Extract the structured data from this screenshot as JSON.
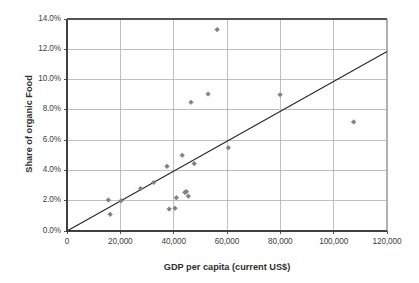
{
  "chart_data": {
    "type": "scatter",
    "title": "",
    "xlabel": "GDP per capita (current US$)",
    "ylabel": "Share of organic Food",
    "xlim": [
      0,
      120000
    ],
    "ylim": [
      0,
      0.14
    ],
    "grid": true,
    "legend": false,
    "x_ticks": [
      0,
      20000,
      40000,
      60000,
      80000,
      100000,
      120000
    ],
    "x_tick_labels": [
      "0",
      "20,000",
      "40,000",
      "60,000",
      "80,000",
      "100,000",
      "120,000"
    ],
    "y_ticks": [
      0.0,
      0.02,
      0.04,
      0.06,
      0.08,
      0.1,
      0.12,
      0.14
    ],
    "y_tick_labels": [
      "0.0%",
      "2.0%",
      "4.0%",
      "6.0%",
      "8.0%",
      "10.0%",
      "12.0%",
      "14.0%"
    ],
    "marker_color": "#808080",
    "trendline_color": "#262626",
    "grid_color": "#b0b0b0",
    "axis_color": "#404040",
    "points": [
      {
        "x": 15500,
        "y": 2.05
      },
      {
        "x": 16200,
        "y": 1.1
      },
      {
        "x": 20300,
        "y": 2.0
      },
      {
        "x": 27600,
        "y": 2.8
      },
      {
        "x": 32500,
        "y": 3.2
      },
      {
        "x": 37500,
        "y": 4.27
      },
      {
        "x": 38300,
        "y": 1.45
      },
      {
        "x": 40500,
        "y": 1.5
      },
      {
        "x": 41000,
        "y": 2.2
      },
      {
        "x": 43200,
        "y": 5.0
      },
      {
        "x": 44200,
        "y": 2.55
      },
      {
        "x": 44800,
        "y": 2.6
      },
      {
        "x": 45500,
        "y": 2.3
      },
      {
        "x": 46500,
        "y": 8.5
      },
      {
        "x": 47700,
        "y": 4.45
      },
      {
        "x": 52900,
        "y": 9.05
      },
      {
        "x": 56300,
        "y": 13.3
      },
      {
        "x": 60500,
        "y": 5.5
      },
      {
        "x": 79900,
        "y": 9.0
      },
      {
        "x": 107500,
        "y": 7.2
      }
    ],
    "trendline": {
      "x_start": 0,
      "y_start": 0.0,
      "x_end": 120000,
      "y_end": 11.85,
      "description": "linear fit through origin"
    }
  }
}
